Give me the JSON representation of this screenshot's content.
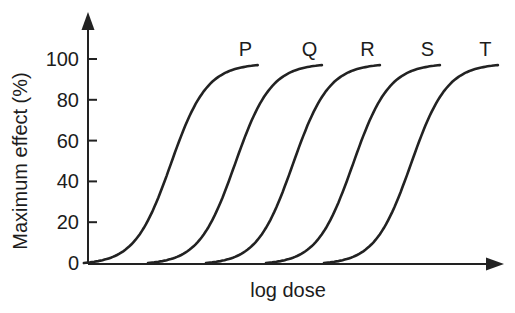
{
  "figure": {
    "background": "#ffffff",
    "line_color": "#222222",
    "text_color": "#1c1c1c"
  },
  "chart_data": {
    "type": "line",
    "title": "",
    "xlabel": "log dose",
    "ylabel": "Maximum effect (%)",
    "grid": false,
    "legend": "none (curves labeled at their plateaus)",
    "x_axis": {
      "label": "log dose",
      "range": [
        0,
        10
      ],
      "ticks": [],
      "arrow": true
    },
    "y_axis": {
      "label": "Maximum effect (%)",
      "range": [
        0,
        110
      ],
      "ticks": [
        0,
        20,
        40,
        60,
        80,
        100
      ],
      "arrow": true
    },
    "curve_model": "sigmoid",
    "slope_k": 2.3,
    "half_span": 2.1,
    "series": [
      {
        "name": "P",
        "ec50": 2.0,
        "emax": 97
      },
      {
        "name": "Q",
        "ec50": 3.55,
        "emax": 97
      },
      {
        "name": "R",
        "ec50": 4.95,
        "emax": 97
      },
      {
        "name": "S",
        "ec50": 6.4,
        "emax": 97
      },
      {
        "name": "T",
        "ec50": 7.8,
        "emax": 97
      }
    ]
  }
}
